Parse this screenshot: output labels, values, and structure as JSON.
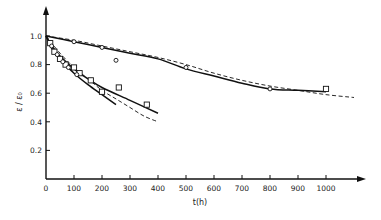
{
  "chart_data": {
    "type": "line",
    "title": "",
    "xlabel": "t(h)",
    "ylabel": "ε / ε₀",
    "xlim": [
      0,
      1100
    ],
    "ylim": [
      0,
      1.1
    ],
    "grid": false,
    "legend": "none",
    "x_ticks": [
      0,
      100,
      200,
      300,
      400,
      500,
      600,
      700,
      800,
      900,
      1000
    ],
    "x_tick_labels": [
      "0",
      "100",
      "200",
      "300",
      "400",
      "500",
      "600",
      "700",
      "800",
      "900",
      "1000"
    ],
    "y_ticks": [
      0.2,
      0.4,
      0.6,
      0.8,
      1.0
    ],
    "y_tick_labels": [
      "0.2",
      "0.4",
      "0.6",
      "0.8",
      "1.0"
    ],
    "series": [
      {
        "name": "upper-solid-fit",
        "style": "solid",
        "x": [
          0,
          100,
          200,
          300,
          400,
          500,
          600,
          700,
          800,
          900,
          1000
        ],
        "y": [
          1.0,
          0.96,
          0.92,
          0.88,
          0.84,
          0.77,
          0.72,
          0.67,
          0.63,
          0.62,
          0.61
        ]
      },
      {
        "name": "upper-dashed-fit",
        "style": "dashed",
        "x": [
          0,
          100,
          200,
          300,
          400,
          500,
          600,
          700,
          800,
          900,
          1000,
          1100
        ],
        "y": [
          1.0,
          0.97,
          0.93,
          0.89,
          0.85,
          0.8,
          0.74,
          0.69,
          0.65,
          0.62,
          0.59,
          0.57
        ]
      },
      {
        "name": "upper-circles",
        "style": "marker-circle",
        "x": [
          100,
          200,
          250,
          500,
          800
        ],
        "y": [
          0.96,
          0.92,
          0.83,
          0.78,
          0.63
        ]
      },
      {
        "name": "upper-squares",
        "style": "marker-square",
        "x": [
          1000
        ],
        "y": [
          0.63
        ]
      },
      {
        "name": "lower-solid-fit-1",
        "style": "solid",
        "x": [
          0,
          25,
          50,
          100,
          150,
          200,
          250
        ],
        "y": [
          1.0,
          0.9,
          0.84,
          0.74,
          0.66,
          0.59,
          0.52
        ]
      },
      {
        "name": "lower-solid-fit-2",
        "style": "solid",
        "x": [
          0,
          25,
          50,
          100,
          150,
          200,
          300,
          400
        ],
        "y": [
          1.0,
          0.92,
          0.86,
          0.77,
          0.7,
          0.64,
          0.55,
          0.46
        ]
      },
      {
        "name": "lower-dashed-fit",
        "style": "dashed",
        "x": [
          0,
          50,
          100,
          150,
          200,
          250,
          300,
          350,
          400
        ],
        "y": [
          1.0,
          0.88,
          0.78,
          0.7,
          0.62,
          0.56,
          0.5,
          0.44,
          0.4
        ]
      },
      {
        "name": "lower-squares",
        "style": "marker-square",
        "x": [
          15,
          30,
          50,
          70,
          100,
          120,
          160,
          200,
          260,
          360
        ],
        "y": [
          0.95,
          0.89,
          0.84,
          0.8,
          0.78,
          0.74,
          0.69,
          0.61,
          0.64,
          0.52
        ]
      },
      {
        "name": "lower-circles",
        "style": "marker-circle",
        "x": [
          20,
          40,
          60,
          80,
          110
        ],
        "y": [
          0.93,
          0.87,
          0.82,
          0.78,
          0.73
        ]
      }
    ]
  }
}
